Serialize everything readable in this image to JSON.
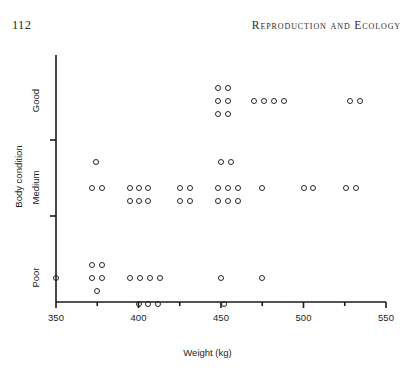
{
  "page": {
    "folio": "112",
    "running_title": "Reproduction and Ecology"
  },
  "chart_data": {
    "type": "scatter",
    "title": "",
    "xlabel": "Weight (kg)",
    "ylabel": "Body condition",
    "xlim": [
      350,
      550
    ],
    "ylim_categories": [
      "Poor",
      "Medium",
      "Good"
    ],
    "x_major_ticks": [
      350,
      400,
      450,
      500,
      550
    ],
    "x_minor_ticks": [
      375,
      425,
      475,
      525
    ],
    "x_tick_labels": [
      "350",
      "400",
      "450",
      "500",
      "550"
    ],
    "y_tick_labels": [
      "Good",
      "Medium",
      "Poor"
    ],
    "grid": false,
    "legend": "none",
    "marker": "open-circle",
    "marker_color": "#262626",
    "note": "Jittered categorical scatter: each open circle is one animal; vertical spread within a condition band is jitter, not a value.",
    "points": [
      {
        "weight": 350,
        "condition": "Poor",
        "jitter": 0
      },
      {
        "weight": 372,
        "condition": "Poor",
        "jitter": 0
      },
      {
        "weight": 372,
        "condition": "Poor",
        "jitter": -1
      },
      {
        "weight": 378,
        "condition": "Poor",
        "jitter": 0
      },
      {
        "weight": 378,
        "condition": "Poor",
        "jitter": -1
      },
      {
        "weight": 375,
        "condition": "Poor",
        "jitter": 1
      },
      {
        "weight": 395,
        "condition": "Poor",
        "jitter": 0
      },
      {
        "weight": 401,
        "condition": "Poor",
        "jitter": 0
      },
      {
        "weight": 407,
        "condition": "Poor",
        "jitter": 0
      },
      {
        "weight": 413,
        "condition": "Poor",
        "jitter": 0
      },
      {
        "weight": 450,
        "condition": "Poor",
        "jitter": 0
      },
      {
        "weight": 475,
        "condition": "Poor",
        "jitter": 0
      },
      {
        "weight": 400,
        "condition": "Poor",
        "jitter": 2
      },
      {
        "weight": 406,
        "condition": "Poor",
        "jitter": 2
      },
      {
        "weight": 412,
        "condition": "Poor",
        "jitter": 2
      },
      {
        "weight": 452,
        "condition": "Poor",
        "jitter": 2
      },
      {
        "weight": 372,
        "condition": "Medium",
        "jitter": 0
      },
      {
        "weight": 378,
        "condition": "Medium",
        "jitter": 0
      },
      {
        "weight": 395,
        "condition": "Medium",
        "jitter": 0
      },
      {
        "weight": 400,
        "condition": "Medium",
        "jitter": 0
      },
      {
        "weight": 406,
        "condition": "Medium",
        "jitter": 0
      },
      {
        "weight": 395,
        "condition": "Medium",
        "jitter": 1
      },
      {
        "weight": 400,
        "condition": "Medium",
        "jitter": 1
      },
      {
        "weight": 406,
        "condition": "Medium",
        "jitter": 1
      },
      {
        "weight": 425,
        "condition": "Medium",
        "jitter": 0
      },
      {
        "weight": 431,
        "condition": "Medium",
        "jitter": 0
      },
      {
        "weight": 425,
        "condition": "Medium",
        "jitter": 1
      },
      {
        "weight": 431,
        "condition": "Medium",
        "jitter": 1
      },
      {
        "weight": 448,
        "condition": "Medium",
        "jitter": 0
      },
      {
        "weight": 454,
        "condition": "Medium",
        "jitter": 0
      },
      {
        "weight": 460,
        "condition": "Medium",
        "jitter": 0
      },
      {
        "weight": 448,
        "condition": "Medium",
        "jitter": 1
      },
      {
        "weight": 454,
        "condition": "Medium",
        "jitter": 1
      },
      {
        "weight": 460,
        "condition": "Medium",
        "jitter": 1
      },
      {
        "weight": 475,
        "condition": "Medium",
        "jitter": 0
      },
      {
        "weight": 500,
        "condition": "Medium",
        "jitter": 0
      },
      {
        "weight": 506,
        "condition": "Medium",
        "jitter": 0
      },
      {
        "weight": 526,
        "condition": "Medium",
        "jitter": 0
      },
      {
        "weight": 532,
        "condition": "Medium",
        "jitter": 0
      },
      {
        "weight": 374,
        "condition": "Medium",
        "jitter": -2
      },
      {
        "weight": 450,
        "condition": "Medium",
        "jitter": -2
      },
      {
        "weight": 456,
        "condition": "Medium",
        "jitter": -2
      },
      {
        "weight": 448,
        "condition": "Good",
        "jitter": 1
      },
      {
        "weight": 454,
        "condition": "Good",
        "jitter": 1
      },
      {
        "weight": 448,
        "condition": "Good",
        "jitter": 0
      },
      {
        "weight": 454,
        "condition": "Good",
        "jitter": 0
      },
      {
        "weight": 448,
        "condition": "Good",
        "jitter": -1
      },
      {
        "weight": 454,
        "condition": "Good",
        "jitter": -1
      },
      {
        "weight": 470,
        "condition": "Good",
        "jitter": 0
      },
      {
        "weight": 476,
        "condition": "Good",
        "jitter": 0
      },
      {
        "weight": 482,
        "condition": "Good",
        "jitter": 0
      },
      {
        "weight": 488,
        "condition": "Good",
        "jitter": 0
      },
      {
        "weight": 528,
        "condition": "Good",
        "jitter": 0
      },
      {
        "weight": 534,
        "condition": "Good",
        "jitter": 0
      }
    ]
  }
}
